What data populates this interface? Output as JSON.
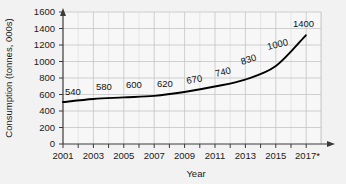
{
  "chart_data": {
    "type": "line",
    "title": "",
    "xlabel": "Year",
    "ylabel": "Consumption (tonnes, 000s)",
    "xlim": [
      2001,
      2018
    ],
    "ylim": [
      0,
      1700
    ],
    "grid": true,
    "legend": null,
    "x_tick_labels": [
      "2001",
      "2003",
      "2005",
      "2007",
      "2009",
      "2011",
      "2013",
      "2015",
      "2017*"
    ],
    "x_tick_values": [
      2001,
      2003,
      2005,
      2007,
      2009,
      2011,
      2013,
      2015,
      2017
    ],
    "y_tick_labels": [
      "0",
      "200",
      "400",
      "600",
      "800",
      "1000",
      "1200",
      "1400",
      "1600"
    ],
    "y_tick_values": [
      0,
      200,
      400,
      600,
      800,
      1000,
      1200,
      1400,
      1600
    ],
    "x": [
      2001,
      2003,
      2005,
      2007,
      2009,
      2011,
      2013,
      2015,
      2017
    ],
    "values": [
      540,
      580,
      600,
      620,
      670,
      740,
      830,
      1000,
      1400
    ],
    "point_labels": [
      "540",
      "580",
      "600",
      "620",
      "670",
      "740",
      "830",
      "1000",
      "1400"
    ],
    "series": [
      {
        "name": "Consumption",
        "values": [
          540,
          580,
          600,
          620,
          670,
          740,
          830,
          1000,
          1400
        ],
        "color": "#000000"
      }
    ],
    "note": "2017*"
  },
  "colors": {
    "background": "#f2f2f2",
    "plot_background": "#f7f7f7",
    "grid_major": "#c4c4c4",
    "grid_minor": "#dedede",
    "axis": "#3a3a3a",
    "curve": "#000000",
    "text": "#1a1a1a"
  }
}
